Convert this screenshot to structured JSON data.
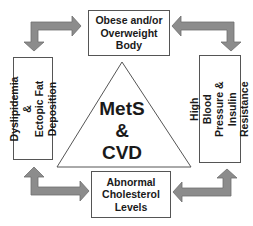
{
  "diagram": {
    "center": {
      "label": "MetS\n&\nCVD",
      "shape": "triangle"
    },
    "nodes": {
      "top": {
        "label": "Obese and/or\nOverweight\nBody"
      },
      "left": {
        "label": "Dyslipidemia &\nEctopic Fat\nDeposition"
      },
      "right": {
        "label": "High Blood\nPressure &\nInsulin Resistance"
      },
      "bottom": {
        "label": "Abnormal\nCholesterol\nLevels"
      }
    },
    "arrows": [
      {
        "name": "top-left",
        "from": "left",
        "to": "top",
        "bidirectional": true
      },
      {
        "name": "top-right",
        "from": "top",
        "to": "right",
        "bidirectional": true
      },
      {
        "name": "bottom-left",
        "from": "left",
        "to": "bottom",
        "bidirectional": true
      },
      {
        "name": "bottom-right",
        "from": "bottom",
        "to": "right",
        "bidirectional": true
      }
    ],
    "colors": {
      "arrow_fill": "#8c8c8c",
      "arrow_stroke": "#6e6e6e",
      "box_border": "#555555",
      "text": "#1a1a1a"
    }
  }
}
